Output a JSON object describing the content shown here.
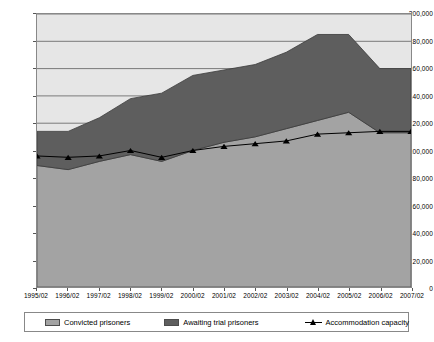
{
  "chart_data": {
    "type": "area",
    "title": "",
    "subtitle": "",
    "xlabel": "",
    "ylabel": "",
    "stacked": true,
    "grid": true,
    "legend_position": "bottom",
    "ylim": [
      0,
      200000
    ],
    "ytick_step": 20000,
    "categories": [
      "1995/02",
      "1996/02",
      "1997/02",
      "1998/02",
      "1999/02",
      "2000/02",
      "2001/02",
      "2002/02",
      "2003/02",
      "2004/02",
      "2005/02",
      "2006/02",
      "2007/02"
    ],
    "ytick_labels": [
      "0",
      "20,000",
      "40,000",
      "60,000",
      "80,000",
      "100,000",
      "120,000",
      "140,000",
      "160,000",
      "180,000",
      "200,000"
    ],
    "ytick_values": [
      0,
      20000,
      40000,
      60000,
      80000,
      100000,
      120000,
      140000,
      160000,
      180000,
      200000
    ],
    "series": [
      {
        "name": "Convicted prisoners",
        "key": "convicted",
        "color": "#a3a3a3",
        "stroke": "#4d4d4d",
        "values": [
          89000,
          86000,
          92000,
          97000,
          92000,
          100000,
          106000,
          110000,
          116000,
          122000,
          128000,
          113000,
          113000
        ]
      },
      {
        "name": "Awaiting trial prisoners",
        "key": "awaiting",
        "color": "#5e5e5e",
        "stroke": "#3a3a3a",
        "values": [
          25000,
          28000,
          32000,
          41000,
          50000,
          55000,
          53000,
          53000,
          56000,
          63000,
          57000,
          47000,
          47000
        ]
      }
    ],
    "stacked_totals": [
      114000,
      114000,
      124000,
      138000,
      142000,
      155000,
      159000,
      163000,
      172000,
      185000,
      185000,
      160000,
      160000
    ],
    "line_series": {
      "name": "Accommodation capacity",
      "key": "capacity",
      "color": "#000000",
      "marker": "triangle",
      "values": [
        96000,
        95000,
        96000,
        100000,
        95000,
        100000,
        103000,
        105000,
        107000,
        112000,
        113000,
        114000,
        114000
      ]
    }
  },
  "legend": {
    "items": [
      {
        "label": "Convicted prisoners",
        "swatch": "#a3a3a3",
        "icon": "square-swatch"
      },
      {
        "label": "Awaiting trial prisoners",
        "swatch": "#5e5e5e",
        "icon": "square-swatch"
      },
      {
        "label": "Accommodation capacity",
        "swatch": "#000000",
        "icon": "triangle-line-marker"
      }
    ]
  },
  "colors": {
    "convicted": "#a3a3a3",
    "awaiting": "#5e5e5e",
    "capacity": "#000000",
    "plot_background": "#e6e6e6",
    "gridline": "#7a7a7a",
    "axis": "#888888"
  }
}
